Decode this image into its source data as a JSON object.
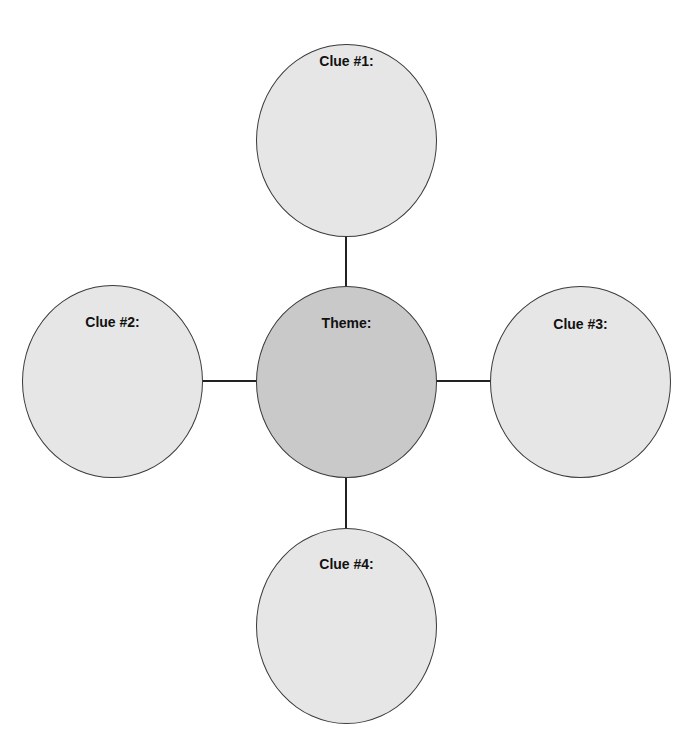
{
  "diagram": {
    "type": "theme-web",
    "colors": {
      "clue_fill": "#e6e6e6",
      "theme_fill": "#c9c9c9",
      "stroke": "#3a3a3a",
      "connector": "#222222"
    },
    "center": {
      "label": "Theme:"
    },
    "clues": [
      {
        "label": "Clue #1:",
        "position": "top"
      },
      {
        "label": "Clue #2:",
        "position": "left"
      },
      {
        "label": "Clue #3:",
        "position": "right"
      },
      {
        "label": "Clue #4:",
        "position": "bottom"
      }
    ]
  }
}
